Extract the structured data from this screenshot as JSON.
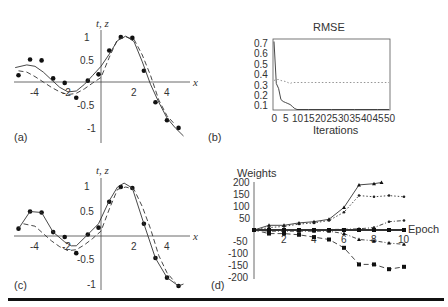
{
  "figure": {
    "panels": {
      "a": {
        "label": "(a)",
        "ylabel": "t, z",
        "xlabel": "x",
        "yticks": [
          "1",
          "0.5",
          "-0.5",
          "-1"
        ],
        "xticks": [
          "-4",
          "-2",
          "2",
          "4"
        ]
      },
      "b": {
        "label": "(b)",
        "title": "RMSE",
        "xlabel": "Iterations",
        "yticks": [
          "0.7",
          "0.6",
          "0.5",
          "0.4",
          "0.3",
          "0.2",
          "0.1"
        ],
        "xticks": [
          "0",
          "5",
          "10",
          "15",
          "20",
          "25",
          "30",
          "35",
          "40",
          "45",
          "50"
        ]
      },
      "c": {
        "label": "(c)",
        "ylabel": "t, z",
        "xlabel": "x",
        "yticks": [
          "1",
          "0.5",
          "-0.5",
          "-1"
        ],
        "xticks": [
          "-4",
          "-2",
          "2",
          "4"
        ]
      },
      "d": {
        "label": "(d)",
        "ylabel": "Weights",
        "xlabel": "Epoch",
        "yticks": [
          "200",
          "150",
          "100",
          "50",
          "-50",
          "-100",
          "-150",
          "-200"
        ],
        "xticks": [
          "2",
          "4",
          "6",
          "8",
          "10"
        ]
      }
    }
  },
  "chart_data": [
    {
      "panel": "a",
      "type": "scatter",
      "title": "",
      "xlabel": "x",
      "ylabel": "t, z",
      "xlim": [
        -5.5,
        5.5
      ],
      "ylim": [
        -1.2,
        1.2
      ],
      "series": [
        {
          "name": "targets t",
          "style": "dots",
          "x": [
            -5.0,
            -4.3,
            -3.6,
            -2.9,
            -2.2,
            -1.5,
            -0.8,
            -0.15,
            0.5,
            1.2,
            1.9,
            2.6,
            3.3,
            4.0,
            4.7
          ],
          "y": [
            0.15,
            0.5,
            0.48,
            0.08,
            -0.02,
            -0.35,
            0.03,
            0.17,
            0.7,
            1.0,
            0.98,
            0.25,
            -0.45,
            -0.85,
            -1.02
          ]
        },
        {
          "name": "network output z",
          "style": "solid",
          "x": [
            -5.2,
            -4.5,
            -4.0,
            -3.5,
            -3.0,
            -2.5,
            -2.0,
            -1.5,
            -1.0,
            -0.5,
            0.0,
            0.5,
            1.0,
            1.5,
            2.0,
            2.5,
            3.0,
            3.5,
            4.0,
            4.5,
            5.0
          ],
          "y": [
            0.32,
            0.38,
            0.35,
            0.22,
            0.05,
            -0.12,
            -0.22,
            -0.2,
            -0.05,
            0.15,
            0.35,
            0.62,
            0.92,
            1.02,
            0.9,
            0.45,
            -0.05,
            -0.45,
            -0.8,
            -1.02,
            -1.2
          ]
        },
        {
          "name": "target function",
          "style": "dashed",
          "x": [
            -5.0,
            -4.5,
            -4.0,
            -3.5,
            -3.0,
            -2.5,
            -2.0,
            -1.5,
            -1.0,
            -0.5,
            0.0,
            0.5,
            1.0,
            1.5,
            2.0,
            2.5,
            3.0,
            3.5,
            4.0,
            4.5
          ],
          "y": [
            0.25,
            0.22,
            0.12,
            0.0,
            -0.12,
            -0.22,
            -0.28,
            -0.25,
            -0.15,
            -0.02,
            0.1,
            0.55,
            0.95,
            1.0,
            0.95,
            0.6,
            0.15,
            -0.4,
            -0.75,
            -0.95
          ]
        }
      ]
    },
    {
      "panel": "b",
      "type": "line",
      "title": "RMSE",
      "xlabel": "Iterations",
      "ylabel": "",
      "xlim": [
        0,
        50
      ],
      "ylim": [
        0.05,
        0.75
      ],
      "grid": false,
      "series": [
        {
          "name": "training RMSE",
          "style": "solid",
          "x": [
            0,
            1,
            2,
            3,
            4,
            5,
            6,
            7,
            8,
            9,
            10,
            15,
            20,
            25,
            30,
            35,
            40,
            45,
            50
          ],
          "y": [
            0.72,
            0.3,
            0.25,
            0.14,
            0.12,
            0.11,
            0.1,
            0.09,
            0.07,
            0.05,
            0.04,
            0.04,
            0.04,
            0.04,
            0.04,
            0.04,
            0.04,
            0.04,
            0.04
          ]
        },
        {
          "name": "test RMSE",
          "style": "dotted",
          "x": [
            0,
            1,
            2,
            3,
            5,
            7,
            8,
            10,
            15,
            20,
            25,
            30,
            35,
            40,
            45,
            50
          ],
          "y": [
            0.33,
            0.34,
            0.34,
            0.33,
            0.32,
            0.3,
            0.31,
            0.31,
            0.31,
            0.31,
            0.31,
            0.31,
            0.31,
            0.31,
            0.31,
            0.31
          ]
        }
      ]
    },
    {
      "panel": "c",
      "type": "scatter",
      "title": "",
      "xlabel": "x",
      "ylabel": "t, z",
      "xlim": [
        -5.5,
        5.5
      ],
      "ylim": [
        -1.2,
        1.2
      ],
      "series": [
        {
          "name": "targets t",
          "style": "dots",
          "x": [
            -5.0,
            -4.3,
            -3.6,
            -2.9,
            -2.2,
            -1.5,
            -0.8,
            -0.15,
            0.5,
            1.2,
            1.9,
            2.6,
            3.3,
            4.0,
            4.7
          ],
          "y": [
            0.15,
            0.5,
            0.48,
            0.08,
            -0.02,
            -0.35,
            0.03,
            0.17,
            0.7,
            1.0,
            0.98,
            0.25,
            -0.45,
            -0.85,
            -1.02
          ]
        },
        {
          "name": "network output z",
          "style": "solid",
          "x": [
            -5.0,
            -4.3,
            -3.6,
            -2.9,
            -2.2,
            -1.8,
            -1.5,
            -0.8,
            -0.15,
            0.5,
            1.0,
            1.4,
            1.9,
            2.6,
            3.3,
            4.0,
            4.7,
            5.0
          ],
          "y": [
            0.15,
            0.5,
            0.48,
            0.08,
            -0.12,
            -0.2,
            -0.2,
            0.03,
            0.25,
            0.72,
            1.0,
            1.08,
            0.98,
            0.25,
            -0.45,
            -0.85,
            -1.02,
            -0.98
          ]
        },
        {
          "name": "target function",
          "style": "dashed",
          "x": [
            -4.7,
            -4.0,
            -3.5,
            -3.0,
            -2.5,
            -2.0,
            -1.5,
            -1.0,
            -0.5,
            0.0,
            0.5,
            1.0,
            1.5,
            2.0,
            2.5,
            3.0,
            3.5,
            4.0,
            4.5
          ],
          "y": [
            0.25,
            0.2,
            0.05,
            -0.1,
            -0.22,
            -0.3,
            -0.28,
            -0.18,
            -0.05,
            0.1,
            0.55,
            0.95,
            1.0,
            0.95,
            0.6,
            0.15,
            -0.4,
            -0.75,
            -0.95
          ]
        }
      ]
    },
    {
      "panel": "d",
      "type": "line",
      "title": "",
      "xlabel": "Epoch",
      "ylabel": "Weights",
      "xlim": [
        0,
        10
      ],
      "ylim": [
        -200,
        200
      ],
      "grid": false,
      "series": [
        {
          "name": "w1",
          "style": "solid-triangle",
          "x": [
            0,
            1,
            2,
            3,
            4,
            5,
            6,
            7,
            8,
            8.5
          ],
          "y": [
            0,
            20,
            20,
            30,
            35,
            45,
            95,
            190,
            195,
            200
          ]
        },
        {
          "name": "w2",
          "style": "dotted-star",
          "x": [
            0,
            1,
            2,
            3,
            4,
            5,
            6,
            7,
            8,
            9,
            10
          ],
          "y": [
            0,
            10,
            15,
            25,
            30,
            40,
            75,
            145,
            140,
            145,
            140
          ]
        },
        {
          "name": "w3",
          "style": "dashdot-plus",
          "x": [
            0,
            1,
            2,
            3,
            4,
            5,
            6,
            7,
            8,
            9,
            10
          ],
          "y": [
            0,
            0,
            0,
            2,
            2,
            2,
            3,
            5,
            10,
            35,
            40
          ]
        },
        {
          "name": "w4",
          "style": "thick-square",
          "x": [
            0,
            1,
            2,
            3,
            4,
            5,
            6,
            7,
            8,
            9,
            10
          ],
          "y": [
            0,
            0,
            0,
            0,
            0,
            0,
            0,
            0,
            0,
            0,
            0
          ]
        },
        {
          "name": "w5",
          "style": "dashdot-triangle",
          "x": [
            0,
            1,
            2,
            3,
            4,
            5,
            6,
            7,
            8,
            9,
            10
          ],
          "y": [
            0,
            -5,
            -5,
            -5,
            -5,
            -5,
            -15,
            -40,
            -45,
            -55,
            -60
          ]
        },
        {
          "name": "w6",
          "style": "dashed-square",
          "x": [
            0,
            1,
            2,
            3,
            4,
            5,
            6,
            7,
            8,
            9,
            10
          ],
          "y": [
            0,
            -15,
            -15,
            -20,
            -30,
            -40,
            -75,
            -145,
            -145,
            -165,
            -155
          ]
        }
      ]
    }
  ]
}
